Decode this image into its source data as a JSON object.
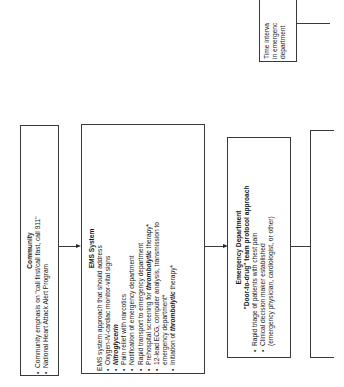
{
  "diagram": {
    "orientation": "rotated-90-ccw",
    "community": {
      "title": "Community",
      "items": [
        "Community emphasis on \"call first/call fast, call 911\"",
        "National Heart Attack Alert Program"
      ]
    },
    "ems": {
      "title": "EMS System",
      "intro": "EMS system approach that should address",
      "items": [
        {
          "text": "Oxygen-IV-cardiac monitor-vital signs"
        },
        {
          "pre": "",
          "em": "Nitroglycerin",
          "post": ""
        },
        {
          "text": "Pain relief with narcotics"
        },
        {
          "text": "Notification of emergency department"
        },
        {
          "text": "Rapid transport to emergency department"
        },
        {
          "pre": "Prehospital screening for ",
          "em": "thrombolytic",
          "post": " therapy*"
        },
        {
          "text": "12-lead ECG, computer analysis, transmission to",
          "cont": "emergency department*"
        },
        {
          "pre": "Initiation of ",
          "em": "thrombolytic",
          "post": " therapy*"
        }
      ]
    },
    "ed": {
      "title": "Emergency Department",
      "subtitle": "\"Door-to-drug\" team protocol approach",
      "items": [
        {
          "text": "Rapid triage of patients with chest pain"
        },
        {
          "text": "Clinical decision maker established",
          "cont": "(emergency physician, cardiologist, or other)"
        }
      ]
    },
    "time_interval": {
      "lines": [
        "Time interva",
        "in emergenc",
        "department"
      ]
    }
  }
}
